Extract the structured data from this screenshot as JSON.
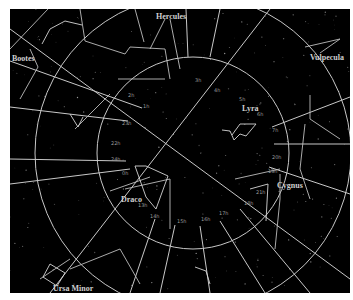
{
  "map": {
    "type": "star-chart",
    "background": "#000000",
    "line_color": "#c8c8c8",
    "center": {
      "x": 183,
      "y": 144
    },
    "constellations": [
      {
        "name": "Hercules",
        "x": 146,
        "y": 10
      },
      {
        "name": "Bootes",
        "x": 2,
        "y": 52
      },
      {
        "name": "Lyra",
        "x": 232,
        "y": 102
      },
      {
        "name": "Vulpecula",
        "x": 300,
        "y": 51
      },
      {
        "name": "Cygnus",
        "x": 267,
        "y": 179
      },
      {
        "name": "Draco",
        "x": 111,
        "y": 193
      },
      {
        "name": "Ursa Minor",
        "x": 43,
        "y": 282
      }
    ],
    "hour_labels": [
      {
        "text": "2h",
        "x": 118,
        "y": 88
      },
      {
        "text": "1h",
        "x": 133,
        "y": 99
      },
      {
        "text": "23h",
        "x": 112,
        "y": 116
      },
      {
        "text": "22h",
        "x": 101,
        "y": 136
      },
      {
        "text": "24h",
        "x": 101,
        "y": 152
      },
      {
        "text": "0h",
        "x": 112,
        "y": 166
      },
      {
        "text": "3h",
        "x": 185,
        "y": 73
      },
      {
        "text": "4h",
        "x": 204,
        "y": 83
      },
      {
        "text": "5h",
        "x": 229,
        "y": 92
      },
      {
        "text": "6h",
        "x": 247,
        "y": 107
      },
      {
        "text": "7h",
        "x": 262,
        "y": 123
      },
      {
        "text": "20h",
        "x": 262,
        "y": 150
      },
      {
        "text": "19h",
        "x": 258,
        "y": 164
      },
      {
        "text": "21h",
        "x": 246,
        "y": 185
      },
      {
        "text": "18h",
        "x": 234,
        "y": 196
      },
      {
        "text": "17h",
        "x": 209,
        "y": 206
      },
      {
        "text": "16h",
        "x": 191,
        "y": 212
      },
      {
        "text": "15h",
        "x": 167,
        "y": 214
      },
      {
        "text": "14h",
        "x": 140,
        "y": 209
      },
      {
        "text": "13h",
        "x": 128,
        "y": 198
      }
    ]
  }
}
